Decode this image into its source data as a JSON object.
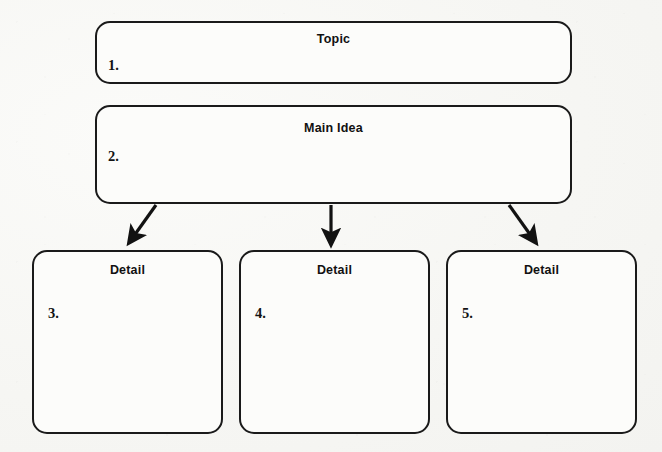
{
  "document": {
    "title": "Topic / Main Idea / Detail Graphic Organizer",
    "background_color": "#f7f7f5",
    "line_color": "#1a1a1a",
    "text_color": "#111111"
  },
  "topic": {
    "heading": "Topic",
    "number": "1.",
    "content": ""
  },
  "main_idea": {
    "heading": "Main Idea",
    "number": "2.",
    "content": ""
  },
  "details": [
    {
      "heading": "Detail",
      "number": "3.",
      "content": ""
    },
    {
      "heading": "Detail",
      "number": "4.",
      "content": ""
    },
    {
      "heading": "Detail",
      "number": "5.",
      "content": ""
    }
  ],
  "connectors": [
    {
      "name": "arrow-to-detail-3",
      "direction": "down-left"
    },
    {
      "name": "arrow-to-detail-4",
      "direction": "down"
    },
    {
      "name": "arrow-to-detail-5",
      "direction": "down-right"
    }
  ]
}
